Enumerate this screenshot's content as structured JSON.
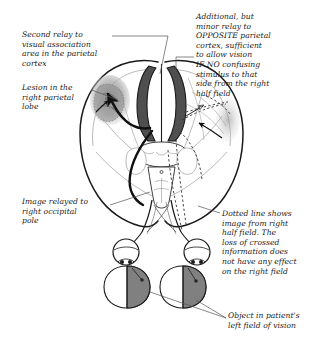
{
  "figure": {
    "view": "superior view of brain with visual pathways and visual fields",
    "background_color": "#ffffff",
    "ink_color": "#1a1a1a",
    "colors": {
      "outline": "#1a1a1a",
      "lesion_fill": "#9a9a9a",
      "occipital_cortex_fill": "#5a5a5a",
      "visual_field_shaded": "#808080",
      "visual_field_clear": "#ffffff",
      "leader_line": "#555555",
      "dotted_pathway": "#333333"
    }
  },
  "annotations": {
    "second_relay": "Second relay to\nvisual association\narea in the parietal\ncortex",
    "lesion": "Lesion in the\nright parietal\nlobe",
    "occipital": "Image relayed to\nright occipital\npole",
    "additional": "Additional, but\nminor relay to\nOPPOSITE parietal\ncortex, sufficient\nto allow vision\nIF NO confusing\nstimulus to that\nside from the right\nhalf field",
    "dotted": "Dotted line shows\nimage from right\nhalf field. The\nloss of crossed\ninformation does\nnot have any effect\non the right field",
    "object": "Object in patient's\nleft field of vision"
  },
  "structures": {
    "left_hemisphere": "left-hemisphere-outline",
    "right_hemisphere": "right-hemisphere-outline",
    "lesion_blob": "parietal-lesion",
    "occipital_left": "left-occipital-cortex",
    "occipital_right": "right-occipital-cortex",
    "brainstem": "brainstem-midbrain",
    "cerebellum": "cerebellum",
    "optic_chiasm": "optic-chiasm",
    "eye_left": "left-eye",
    "eye_right": "right-eye",
    "visual_field_left": "left-visual-field-oval",
    "visual_field_right": "right-visual-field-oval"
  }
}
